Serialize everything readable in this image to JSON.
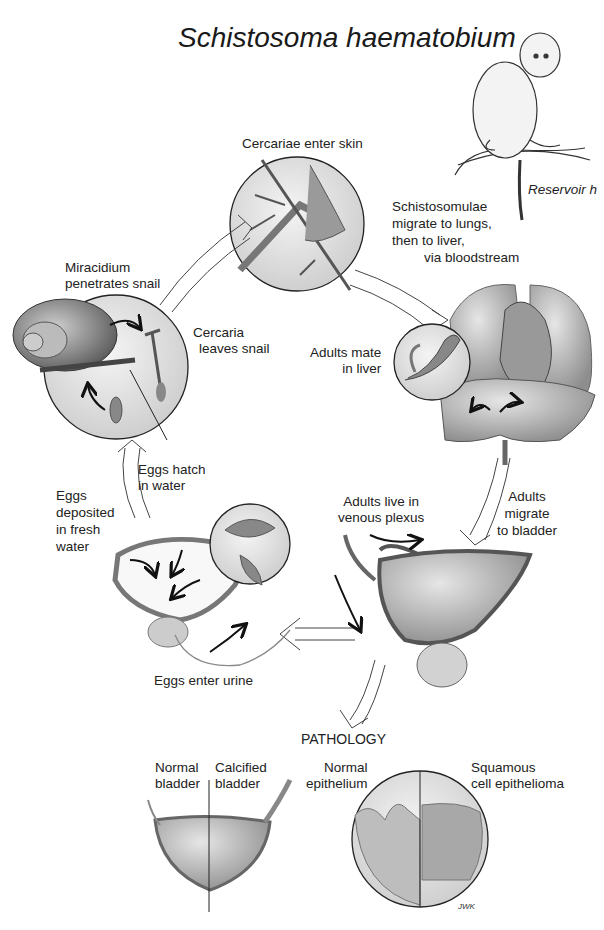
{
  "title": "Schistosoma haematobium",
  "reservoir_host_label": "Reservoir h",
  "stages": {
    "cercariae_enter_skin": "Cercariae enter skin",
    "schistosomulae": [
      "Schistosomulae",
      "migrate to lungs,",
      "then to liver,",
      "via bloodstream"
    ],
    "miracidium": [
      "Miracidium",
      "penetrates snail"
    ],
    "cercaria_leaves": [
      "Cercaria",
      "leaves snail"
    ],
    "adults_mate": [
      "Adults mate",
      "in liver"
    ],
    "eggs_hatch": [
      "Eggs hatch",
      "in water"
    ],
    "eggs_deposited": [
      "Eggs",
      "deposited",
      "in fresh",
      "water"
    ],
    "adults_live": [
      "Adults live in",
      "venous plexus"
    ],
    "adults_migrate": [
      "Adults",
      "migrate",
      "to bladder"
    ],
    "eggs_enter_urine": "Eggs enter urine"
  },
  "pathology": {
    "heading": "PATHOLOGY",
    "normal_bladder": [
      "Normal",
      "bladder"
    ],
    "calcified_bladder": [
      "Calcified",
      "bladder"
    ],
    "normal_epithelium": [
      "Normal",
      "epithelium"
    ],
    "squamous": [
      "Squamous",
      "cell epithelioma"
    ],
    "signature": "JWK"
  }
}
